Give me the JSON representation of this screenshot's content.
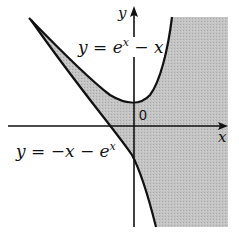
{
  "diagram": {
    "labels": {
      "y_axis": "y",
      "x_axis": "x",
      "origin": "0",
      "upper_curve": {
        "prefix": "y = e",
        "sup": "x",
        "suffix": " − x"
      },
      "lower_curve": {
        "prefix": "y = −x − e",
        "sup": "x",
        "suffix": ""
      }
    },
    "curves": [
      {
        "name": "upper",
        "equation": "y = e^x - x"
      },
      {
        "name": "lower",
        "equation": "y = -x - e^x"
      }
    ],
    "shaded_region": "region to the right of both curves and between them for x<0",
    "colors": {
      "shade": "#bdbdbd",
      "line": "#111111",
      "background": "#ffffff"
    }
  }
}
